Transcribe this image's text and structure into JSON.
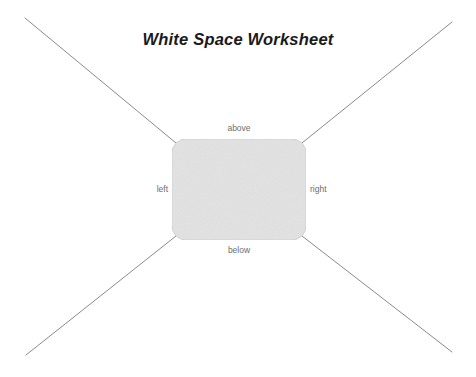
{
  "page": {
    "title": "White Space Worksheet",
    "background_color": "#ffffff"
  },
  "diagram": {
    "content_box": {
      "name": "content-box",
      "fill_color": "#e2e2e2",
      "stroke_color": "#d2d2d2",
      "x": 172,
      "y": 139,
      "width": 134,
      "height": 101,
      "corner_radius": 14
    },
    "labels": {
      "above": "above",
      "left": "left",
      "right": "right",
      "below": "below"
    },
    "label_color": "#6d6d6d",
    "margin_lines": {
      "stroke_color": "#8a8a8a",
      "stroke_width": 1,
      "segments": [
        {
          "name": "top-left-diagonal",
          "x1": 25,
          "y1": 18,
          "x2": 176,
          "y2": 143
        },
        {
          "name": "top-right-diagonal",
          "x1": 452,
          "y1": 22,
          "x2": 302,
          "y2": 143
        },
        {
          "name": "bottom-left-diagonal",
          "x1": 26,
          "y1": 355,
          "x2": 176,
          "y2": 236
        },
        {
          "name": "bottom-right-diagonal",
          "x1": 452,
          "y1": 352,
          "x2": 302,
          "y2": 236
        }
      ]
    }
  }
}
